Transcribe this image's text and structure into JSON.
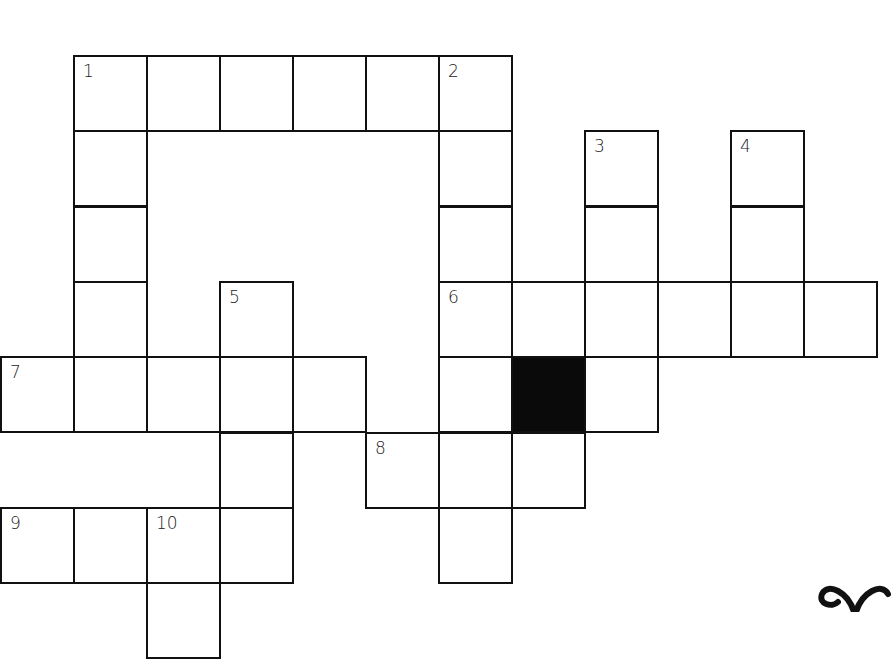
{
  "puzzle": {
    "type": "crossword",
    "cell_size": 73,
    "origin": {
      "x": 1,
      "y": 55
    },
    "cells": [
      {
        "r": 0,
        "c": 1,
        "num": "1"
      },
      {
        "r": 0,
        "c": 2
      },
      {
        "r": 0,
        "c": 3
      },
      {
        "r": 0,
        "c": 4
      },
      {
        "r": 0,
        "c": 5
      },
      {
        "r": 0,
        "c": 6,
        "num": "2"
      },
      {
        "r": 1,
        "c": 1
      },
      {
        "r": 1,
        "c": 6
      },
      {
        "r": 1,
        "c": 8,
        "num": "3"
      },
      {
        "r": 1,
        "c": 10,
        "num": "4"
      },
      {
        "r": 2,
        "c": 1
      },
      {
        "r": 2,
        "c": 6
      },
      {
        "r": 2,
        "c": 8
      },
      {
        "r": 2,
        "c": 10
      },
      {
        "r": 3,
        "c": 1
      },
      {
        "r": 3,
        "c": 3,
        "num": "5"
      },
      {
        "r": 3,
        "c": 6,
        "num": "6"
      },
      {
        "r": 3,
        "c": 7
      },
      {
        "r": 3,
        "c": 8
      },
      {
        "r": 3,
        "c": 9
      },
      {
        "r": 3,
        "c": 10
      },
      {
        "r": 3,
        "c": 11
      },
      {
        "r": 4,
        "c": 0,
        "num": "7"
      },
      {
        "r": 4,
        "c": 1
      },
      {
        "r": 4,
        "c": 2
      },
      {
        "r": 4,
        "c": 3
      },
      {
        "r": 4,
        "c": 4
      },
      {
        "r": 4,
        "c": 6
      },
      {
        "r": 4,
        "c": 7,
        "black": true
      },
      {
        "r": 4,
        "c": 8
      },
      {
        "r": 5,
        "c": 3
      },
      {
        "r": 5,
        "c": 5,
        "num": "8"
      },
      {
        "r": 5,
        "c": 6
      },
      {
        "r": 5,
        "c": 7
      },
      {
        "r": 6,
        "c": 0,
        "num": "9"
      },
      {
        "r": 6,
        "c": 1
      },
      {
        "r": 6,
        "c": 2,
        "num": "10"
      },
      {
        "r": 6,
        "c": 3
      },
      {
        "r": 6,
        "c": 6
      },
      {
        "r": 7,
        "c": 2
      }
    ],
    "clue_numbers": [
      "1",
      "2",
      "3",
      "4",
      "5",
      "6",
      "7",
      "8",
      "9",
      "10"
    ],
    "colors": {
      "line": "#111111",
      "block": "#0a0a0a",
      "background": "#ffffff"
    }
  },
  "decoration": {
    "icon": "bow-icon"
  }
}
